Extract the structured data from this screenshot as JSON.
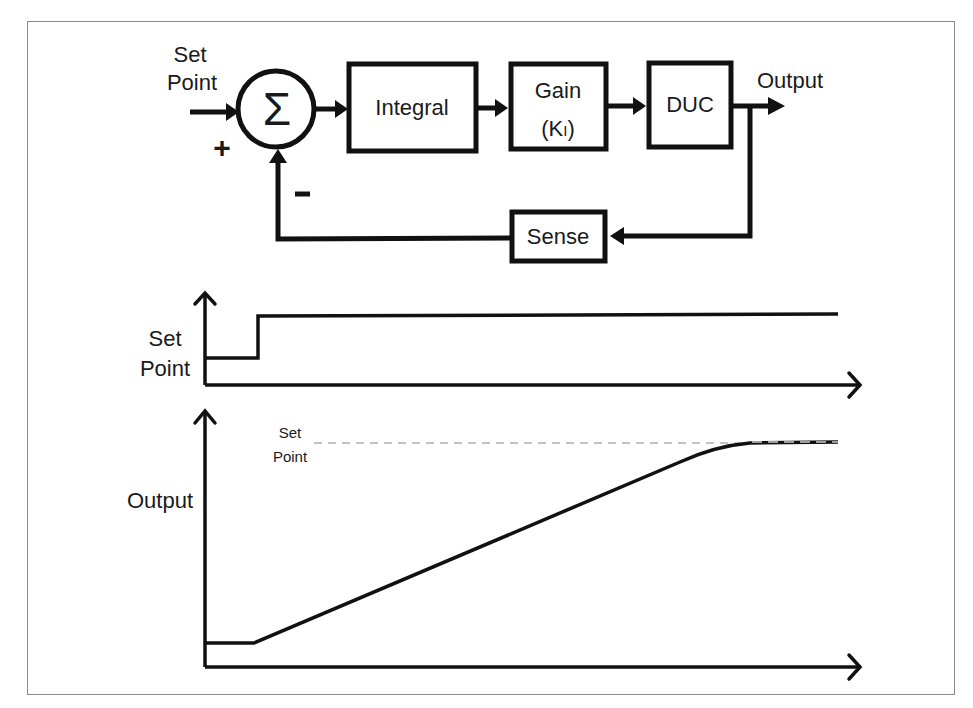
{
  "block_diagram": {
    "input_label_line1": "Set",
    "input_label_line2": "Point",
    "plus_sign": "+",
    "minus_sign": "-",
    "summer_symbol": "Σ",
    "blocks": {
      "integral": "Integral",
      "gain_line1": "Gain",
      "gain_line2_open": "(K",
      "gain_line2_sub": "I",
      "gain_line2_close": ")",
      "duc": "DUC",
      "sense": "Sense"
    },
    "output_label": "Output"
  },
  "setpoint_plot": {
    "ylabel_line1": "Set",
    "ylabel_line2": "Point"
  },
  "output_plot": {
    "ylabel": "Output",
    "setpoint_ref_line1": "Set",
    "setpoint_ref_line2": "Point"
  },
  "colors": {
    "stroke": "#111111",
    "frame": "#8a8a8a",
    "dashed_ref": "#b0b0b0"
  }
}
